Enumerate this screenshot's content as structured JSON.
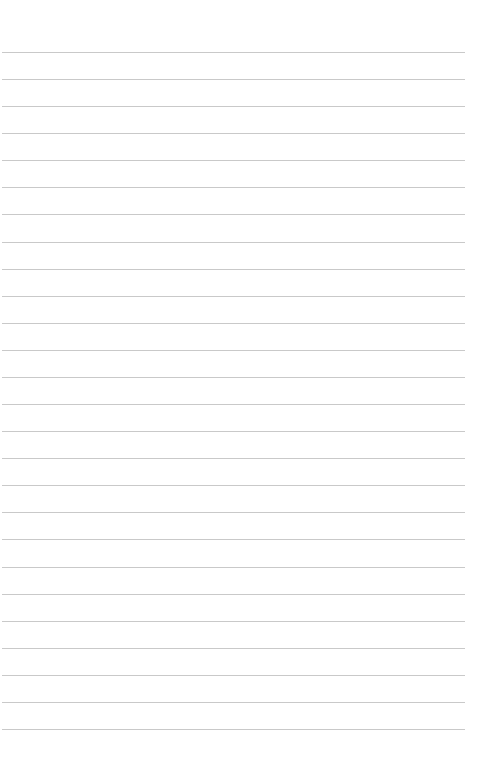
{
  "page": {
    "type": "blank lined sheet",
    "background_color": "#ffffff",
    "rule_color": "#c9c9c9",
    "rule_count": 26,
    "first_rule_y": 52,
    "rule_spacing": 27.08,
    "rule_left": 2,
    "rule_width": 463
  }
}
